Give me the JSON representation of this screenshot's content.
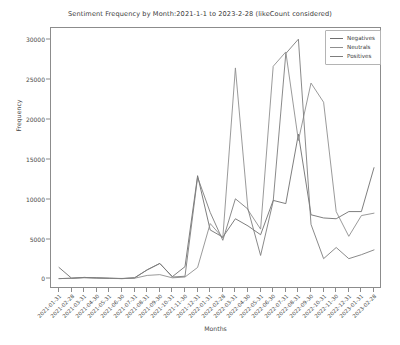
{
  "chart_data": {
    "type": "line",
    "title": "Sentiment Frequency by Month:2021-1-1 to 2023-2-28 (likeCount considered)",
    "xlabel": "Months",
    "ylabel": "Frequency",
    "grid": false,
    "legend_position": "upper right",
    "ylim": [
      -1200,
      31500
    ],
    "yticks": [
      0,
      5000,
      10000,
      15000,
      20000,
      25000,
      30000
    ],
    "ytick_labels": [
      "0",
      "5000",
      "10000",
      "15000",
      "20000",
      "25000",
      "30000"
    ],
    "categories": [
      "2021-01-31",
      "2021-02-28",
      "2021-03-31",
      "2021-04-30",
      "2021-05-31",
      "2021-06-30",
      "2021-07-31",
      "2021-08-31",
      "2021-09-30",
      "2021-10-31",
      "2021-11-30",
      "2021-12-31",
      "2022-01-31",
      "2022-02-28",
      "2022-03-31",
      "2022-04-30",
      "2022-05-31",
      "2022-06-30",
      "2022-07-31",
      "2022-08-31",
      "2022-09-30",
      "2022-10-31",
      "2022-11-30",
      "2022-12-31",
      "2023-01-31",
      "2023-02-28"
    ],
    "series": [
      {
        "name": "Negatives",
        "color": "#6f6f6f",
        "values": [
          1500,
          150,
          250,
          200,
          150,
          100,
          200,
          1200,
          2000,
          350,
          1600,
          13000,
          6200,
          5300,
          7600,
          6700,
          5600,
          9900,
          9500,
          18200,
          8100,
          7700,
          7600,
          8500,
          8500,
          14000
        ]
      },
      {
        "name": "Neutrals",
        "color": "#8f8f8f",
        "values": [
          100,
          150,
          200,
          150,
          120,
          100,
          150,
          500,
          600,
          200,
          300,
          1500,
          7000,
          5200,
          26500,
          8700,
          6300,
          26700,
          28500,
          17400,
          24600,
          22200,
          8500,
          5400,
          8000,
          8300
        ]
      },
      {
        "name": "Positives",
        "color": "#7d7d7d",
        "values": [
          100,
          150,
          250,
          200,
          150,
          120,
          200,
          1200,
          2000,
          300,
          400,
          12800,
          8400,
          4900,
          10100,
          8800,
          3000,
          9800,
          28300,
          30100,
          6900,
          2600,
          4000,
          2600,
          3100,
          3700
        ]
      }
    ]
  },
  "legend": {
    "items": [
      {
        "label": "Negatives"
      },
      {
        "label": "Neutrals"
      },
      {
        "label": "Positives"
      }
    ]
  }
}
